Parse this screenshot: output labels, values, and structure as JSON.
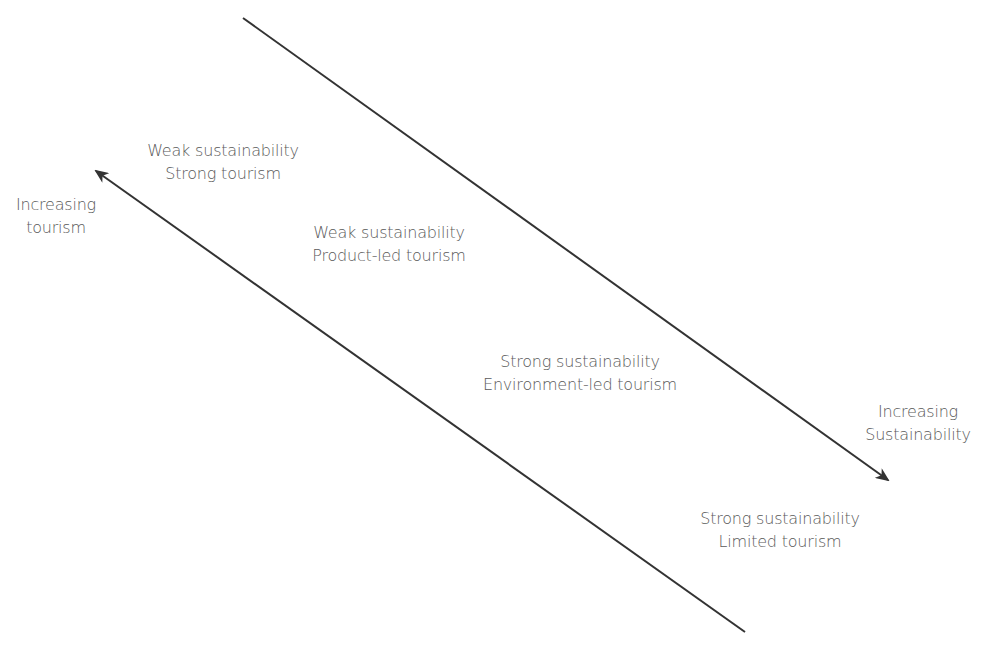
{
  "diagram": {
    "colors": {
      "line": "#333333",
      "text": "#5a5a5a",
      "background": "#ffffff"
    },
    "axes": [
      {
        "id": "tourism-axis",
        "label_lines": [
          "Increasing",
          "tourism"
        ],
        "direction": "up-left"
      },
      {
        "id": "sustainability-axis",
        "label_lines": [
          "Increasing",
          "Sustainability"
        ],
        "direction": "down-right"
      }
    ],
    "zones": [
      {
        "lines": [
          "Weak sustainability",
          "Strong tourism"
        ]
      },
      {
        "lines": [
          "Weak sustainability",
          "Product-led tourism"
        ]
      },
      {
        "lines": [
          "Strong sustainability",
          "Environment-led tourism"
        ]
      },
      {
        "lines": [
          "Strong sustainability",
          "Limited tourism"
        ]
      }
    ]
  }
}
